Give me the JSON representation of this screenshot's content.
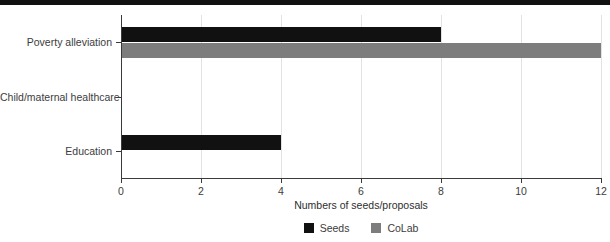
{
  "chart_data": {
    "type": "bar",
    "orientation": "horizontal",
    "title": "",
    "xlabel": "Numbers of seeds/proposals",
    "ylabel": "",
    "categories": [
      "Poverty alleviation",
      "Child/maternal healthcare",
      "Education"
    ],
    "series": [
      {
        "name": "Seeds",
        "color": "#111111",
        "values": [
          8,
          0,
          4
        ]
      },
      {
        "name": "CoLab",
        "color": "#7d7d7d",
        "values": [
          12,
          0,
          0
        ]
      }
    ],
    "xlim": [
      0,
      12
    ],
    "xticks": [
      0,
      2,
      4,
      6,
      8,
      10,
      12
    ],
    "xtick_labels": [
      "0",
      "2",
      "4",
      "6",
      "8",
      "10",
      "12"
    ],
    "grid": "vertical",
    "legend_position": "bottom-center"
  },
  "legend": {
    "items": [
      {
        "label": "Seeds",
        "swatch": "#111111"
      },
      {
        "label": "CoLab",
        "swatch": "#7d7d7d"
      }
    ]
  },
  "decor": {
    "top_strip_color": "#111111"
  }
}
